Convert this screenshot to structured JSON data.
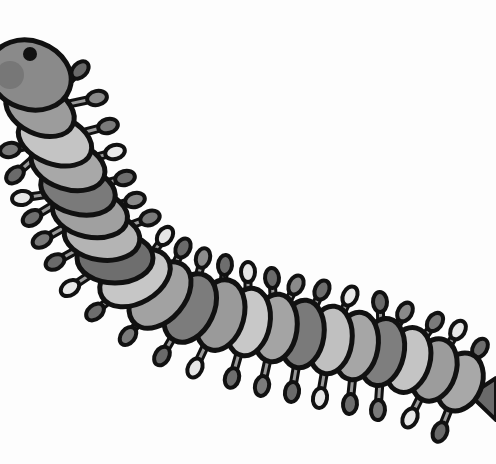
{
  "image": {
    "subject": "cartoon millipede illustration",
    "style": "grayscale",
    "width": 496,
    "height": 464
  },
  "colors": {
    "background": "#fdfdfd",
    "outline": "#111111",
    "head": "#8a8a8a",
    "eye": "#111111",
    "tail": "#6a6a6a"
  },
  "segments": [
    {
      "x": 40,
      "y": 110,
      "rx": 36,
      "ry": 24,
      "rot": 25,
      "fill": "#9c9c9c"
    },
    {
      "x": 55,
      "y": 140,
      "rx": 38,
      "ry": 24,
      "rot": 20,
      "fill": "#c4c4c4"
    },
    {
      "x": 68,
      "y": 165,
      "rx": 38,
      "ry": 24,
      "rot": 18,
      "fill": "#a8a8a8"
    },
    {
      "x": 78,
      "y": 190,
      "rx": 38,
      "ry": 24,
      "rot": 15,
      "fill": "#7a7a7a"
    },
    {
      "x": 90,
      "y": 213,
      "rx": 38,
      "ry": 24,
      "rot": 12,
      "fill": "#a0a0a0"
    },
    {
      "x": 102,
      "y": 236,
      "rx": 38,
      "ry": 24,
      "rot": 8,
      "fill": "#b4b4b4"
    },
    {
      "x": 115,
      "y": 258,
      "rx": 38,
      "ry": 25,
      "rot": 0,
      "fill": "#6e6e6e"
    },
    {
      "x": 135,
      "y": 278,
      "rx": 25,
      "ry": 38,
      "rot": 60,
      "fill": "#c6c6c6"
    },
    {
      "x": 160,
      "y": 295,
      "rx": 25,
      "ry": 38,
      "rot": 40,
      "fill": "#a2a2a2"
    },
    {
      "x": 190,
      "y": 308,
      "rx": 24,
      "ry": 36,
      "rot": 25,
      "fill": "#7c7c7c"
    },
    {
      "x": 220,
      "y": 315,
      "rx": 24,
      "ry": 36,
      "rot": 15,
      "fill": "#9a9a9a"
    },
    {
      "x": 248,
      "y": 322,
      "rx": 22,
      "ry": 34,
      "rot": 10,
      "fill": "#c8c8c8"
    },
    {
      "x": 275,
      "y": 328,
      "rx": 22,
      "ry": 34,
      "rot": 8,
      "fill": "#a4a4a4"
    },
    {
      "x": 302,
      "y": 334,
      "rx": 22,
      "ry": 34,
      "rot": 8,
      "fill": "#7a7a7a"
    },
    {
      "x": 330,
      "y": 340,
      "rx": 22,
      "ry": 34,
      "rot": 8,
      "fill": "#c0c0c0"
    },
    {
      "x": 356,
      "y": 346,
      "rx": 22,
      "ry": 34,
      "rot": 10,
      "fill": "#a6a6a6"
    },
    {
      "x": 382,
      "y": 352,
      "rx": 22,
      "ry": 34,
      "rot": 12,
      "fill": "#7e7e7e"
    },
    {
      "x": 408,
      "y": 360,
      "rx": 22,
      "ry": 33,
      "rot": 15,
      "fill": "#c4c4c4"
    },
    {
      "x": 434,
      "y": 370,
      "rx": 22,
      "ry": 32,
      "rot": 18,
      "fill": "#9c9c9c"
    },
    {
      "x": 460,
      "y": 382,
      "rx": 22,
      "ry": 30,
      "rot": 22,
      "fill": "#a8a8a8"
    }
  ],
  "legs_top": [
    {
      "x": 80,
      "y": 70,
      "fill": "#6a6a6a"
    },
    {
      "x": 97,
      "y": 98,
      "fill": "#8a8a8a"
    },
    {
      "x": 108,
      "y": 126,
      "fill": "#7a7a7a"
    },
    {
      "x": 115,
      "y": 152,
      "fill": "#e8e8e8"
    },
    {
      "x": 125,
      "y": 178,
      "fill": "#6e6e6e"
    },
    {
      "x": 135,
      "y": 200,
      "fill": "#8a8a8a"
    },
    {
      "x": 150,
      "y": 218,
      "fill": "#7a7a7a"
    },
    {
      "x": 165,
      "y": 236,
      "fill": "#e6e6e6"
    },
    {
      "x": 183,
      "y": 248,
      "fill": "#6a6a6a"
    },
    {
      "x": 203,
      "y": 258,
      "fill": "#8c8c8c"
    },
    {
      "x": 225,
      "y": 265,
      "fill": "#6e6e6e"
    },
    {
      "x": 248,
      "y": 272,
      "fill": "#e6e6e6"
    },
    {
      "x": 272,
      "y": 278,
      "fill": "#6a6a6a"
    },
    {
      "x": 296,
      "y": 285,
      "fill": "#8a8a8a"
    },
    {
      "x": 322,
      "y": 290,
      "fill": "#6e6e6e"
    },
    {
      "x": 350,
      "y": 296,
      "fill": "#e8e8e8"
    },
    {
      "x": 380,
      "y": 302,
      "fill": "#6a6a6a"
    },
    {
      "x": 405,
      "y": 312,
      "fill": "#8a8a8a"
    },
    {
      "x": 435,
      "y": 322,
      "fill": "#7a7a7a"
    },
    {
      "x": 458,
      "y": 330,
      "fill": "#e6e6e6"
    },
    {
      "x": 480,
      "y": 348,
      "fill": "#6e6e6e"
    }
  ],
  "legs_bottom": [
    {
      "x": 10,
      "y": 150,
      "fill": "#7a7a7a"
    },
    {
      "x": 15,
      "y": 175,
      "fill": "#6a6a6a"
    },
    {
      "x": 22,
      "y": 198,
      "fill": "#e6e6e6"
    },
    {
      "x": 32,
      "y": 218,
      "fill": "#6e6e6e"
    },
    {
      "x": 42,
      "y": 240,
      "fill": "#7a7a7a"
    },
    {
      "x": 55,
      "y": 262,
      "fill": "#6a6a6a"
    },
    {
      "x": 70,
      "y": 288,
      "fill": "#e8e8e8"
    },
    {
      "x": 95,
      "y": 312,
      "fill": "#6e6e6e"
    },
    {
      "x": 128,
      "y": 336,
      "fill": "#7a7a7a"
    },
    {
      "x": 162,
      "y": 356,
      "fill": "#6a6a6a"
    },
    {
      "x": 195,
      "y": 368,
      "fill": "#e6e6e6"
    },
    {
      "x": 232,
      "y": 378,
      "fill": "#6e6e6e"
    },
    {
      "x": 262,
      "y": 386,
      "fill": "#7a7a7a"
    },
    {
      "x": 292,
      "y": 392,
      "fill": "#6a6a6a"
    },
    {
      "x": 320,
      "y": 398,
      "fill": "#e6e6e6"
    },
    {
      "x": 350,
      "y": 404,
      "fill": "#6e6e6e"
    },
    {
      "x": 378,
      "y": 410,
      "fill": "#7a7a7a"
    },
    {
      "x": 410,
      "y": 418,
      "fill": "#e8e8e8"
    },
    {
      "x": 440,
      "y": 432,
      "fill": "#6a6a6a"
    }
  ]
}
